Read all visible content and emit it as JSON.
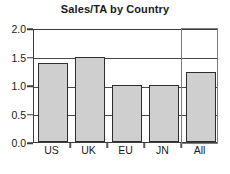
{
  "chart_data": {
    "type": "bar",
    "title": "Sales/TA by Country",
    "xlabel": "",
    "ylabel": "",
    "categories": [
      "US",
      "UK",
      "EU",
      "JN",
      "All"
    ],
    "values": [
      1.38,
      1.5,
      1.0,
      1.0,
      1.22
    ],
    "ylim": [
      0.0,
      2.0
    ],
    "yticks": [
      "0.0",
      "0.5",
      "1.0",
      "1.5",
      "2.0"
    ],
    "ytick_values": [
      0.0,
      0.5,
      1.0,
      1.5,
      2.0
    ],
    "grid": true,
    "legend": false,
    "bar_fill_color": "#cfcfcf",
    "bar_edge_color": "#2e2e2e",
    "frame_color": "#3b3b3b",
    "highlight_color": "#7d7d7d",
    "highlighted_category": "All",
    "annotations": []
  }
}
